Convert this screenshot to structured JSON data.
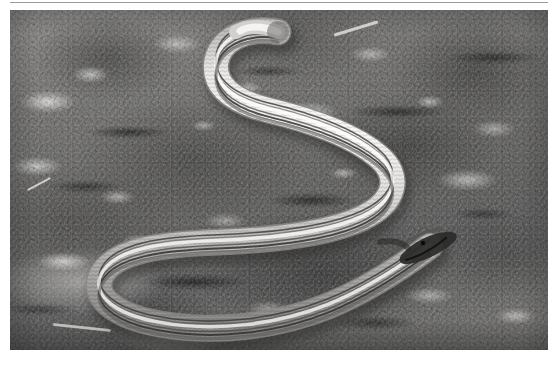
{
  "page": {
    "background_color": "#ffffff",
    "width": 559,
    "height": 365
  },
  "rule": {
    "name": "horizontal-rule",
    "color": "#9a9a9a"
  },
  "photo": {
    "caption": "",
    "alt_text": "A slender silvery legless lizard coiled in an S-curve on rocky gravel ground",
    "subject": "legless lizard",
    "background_subject": "rocky gravel ground",
    "treatment": "desaturated grayscale photograph",
    "frame": {
      "x": 10,
      "y": 10,
      "width": 538,
      "height": 340
    },
    "colors": {
      "ground_light": "#8d8a85",
      "ground_mid": "#6b6965",
      "ground_dark": "#3a3836",
      "pebble_highlight": "#e8e6e0",
      "body_light": "#ece9e1",
      "body_mid": "#c9c5bb",
      "body_shadow": "#8a8780",
      "body_stripe": "#4a4844",
      "head_dark": "#2f2d2b"
    },
    "elements": [
      {
        "name": "lizard-tail-tip",
        "description": "tail tip curling at upper right of the S"
      },
      {
        "name": "lizard-upper-curve",
        "description": "S bend across the top of the frame"
      },
      {
        "name": "lizard-left-loop",
        "description": "wide U loop on the left half"
      },
      {
        "name": "lizard-head",
        "description": "dark pointed head at mid right"
      },
      {
        "name": "dorsal-stripes",
        "description": "dark longitudinal stripes running along the body"
      },
      {
        "name": "scale-texture",
        "description": "fine cross-hatched scale rows"
      }
    ]
  }
}
